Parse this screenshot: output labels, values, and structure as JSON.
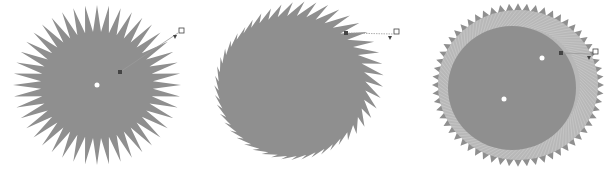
{
  "figure": {
    "colors": {
      "background": "#ffffff",
      "fill": "#8f8f8f",
      "fill_light": "#b8b8b8",
      "handle": "#444444",
      "handle_line": "#9a9a9a"
    },
    "panels": [
      {
        "name": "push-pull-zipper",
        "effect": "zipper",
        "center": [
          97,
          85
        ],
        "spikes": 44,
        "handle": {
          "start": [
            120,
            72
          ],
          "end": [
            181,
            31
          ]
        }
      },
      {
        "name": "twister-distort",
        "effect": "twister",
        "center": [
          292,
          86
        ],
        "spikes": 48,
        "handle": {
          "start": [
            346,
            33
          ],
          "end": [
            396,
            32
          ]
        }
      },
      {
        "name": "twister-rotated-gear",
        "effect": "twister-gear",
        "center": [
          518,
          85
        ],
        "teeth": 60,
        "handle": {
          "start": [
            561,
            53
          ],
          "end": [
            595,
            52
          ]
        }
      }
    ]
  }
}
